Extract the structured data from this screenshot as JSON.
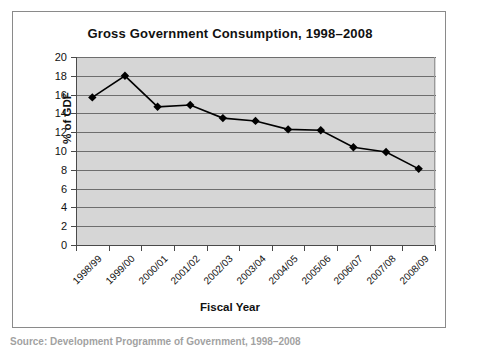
{
  "chart_data": {
    "type": "line",
    "title": "Gross Government Consumption, 1998–2008",
    "xlabel": "Fiscal Year",
    "ylabel": "% of GDF",
    "categories": [
      "1998/99",
      "1999/00",
      "2000/01",
      "2001/02",
      "2002/03",
      "2003/04",
      "2004/05",
      "2005/06",
      "2006/07",
      "2007/08",
      "2008/09"
    ],
    "values": [
      15.7,
      18.0,
      14.7,
      14.9,
      13.5,
      13.2,
      12.3,
      12.2,
      10.4,
      9.9,
      8.1
    ],
    "ylim": [
      0,
      20
    ],
    "ytick_step": 2,
    "yticks": [
      20,
      18,
      16,
      14,
      12,
      10,
      8,
      6,
      4,
      2,
      0
    ],
    "grid": true,
    "legend": false,
    "marker": "diamond",
    "series_color": "#000000",
    "plot_background": "#d6d6d6",
    "gridline_color": "#6e6e6e"
  },
  "caption": {
    "text": "Source: Development Programme of Government, 1998–2008"
  }
}
